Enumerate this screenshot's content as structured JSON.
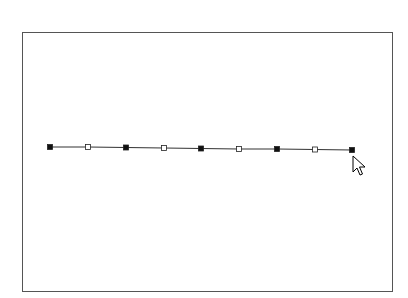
{
  "canvas": {
    "line_color": "#333333",
    "frame_color": "#555555"
  },
  "polyline": {
    "points": [
      {
        "x": 50,
        "y": 147,
        "type": "vertex-filled"
      },
      {
        "x": 88,
        "y": 147,
        "type": "midpoint-hollow"
      },
      {
        "x": 126,
        "y": 147.5,
        "type": "vertex-filled"
      },
      {
        "x": 164,
        "y": 148,
        "type": "midpoint-hollow"
      },
      {
        "x": 201,
        "y": 148.5,
        "type": "vertex-filled"
      },
      {
        "x": 239,
        "y": 149,
        "type": "midpoint-hollow"
      },
      {
        "x": 277,
        "y": 149,
        "type": "vertex-filled"
      },
      {
        "x": 315,
        "y": 149.5,
        "type": "midpoint-hollow"
      },
      {
        "x": 352,
        "y": 150,
        "type": "vertex-filled"
      }
    ]
  },
  "cursor": {
    "x": 353,
    "y": 156,
    "icon": "arrow-pointer-icon"
  }
}
